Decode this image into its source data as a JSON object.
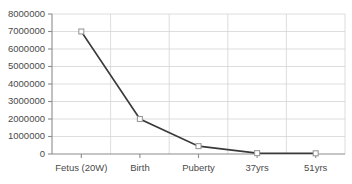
{
  "chart_data": {
    "type": "line",
    "title": "",
    "xlabel": "",
    "ylabel": "",
    "categories": [
      "Fetus (20W)",
      "Birth",
      "Puberty",
      "37yrs",
      "51yrs"
    ],
    "values": [
      7000000,
      2000000,
      450000,
      50000,
      40000
    ],
    "series": [
      {
        "name": "",
        "values": [
          7000000,
          2000000,
          450000,
          50000,
          40000
        ]
      }
    ],
    "ylim": [
      0,
      8000000
    ],
    "ytick_labels": [
      "8000000",
      "7000000",
      "6000000",
      "5000000",
      "4000000",
      "3000000",
      "2000000",
      "1000000",
      "0"
    ],
    "ytick_values": [
      8000000,
      7000000,
      6000000,
      5000000,
      4000000,
      3000000,
      2000000,
      1000000,
      0
    ],
    "grid": true,
    "grid_horizontal": true,
    "grid_vertical": true,
    "legend": false,
    "legend_position": "none",
    "marker": "open-square",
    "colors": {
      "line": "#3a3a3a",
      "marker_fill": "#ffffff",
      "marker_stroke": "#9a9a9a",
      "gridline": "#d4d4d4",
      "axis": "#8c8c8c",
      "tick_text": "#4a4a4a",
      "background": "#ffffff"
    }
  }
}
